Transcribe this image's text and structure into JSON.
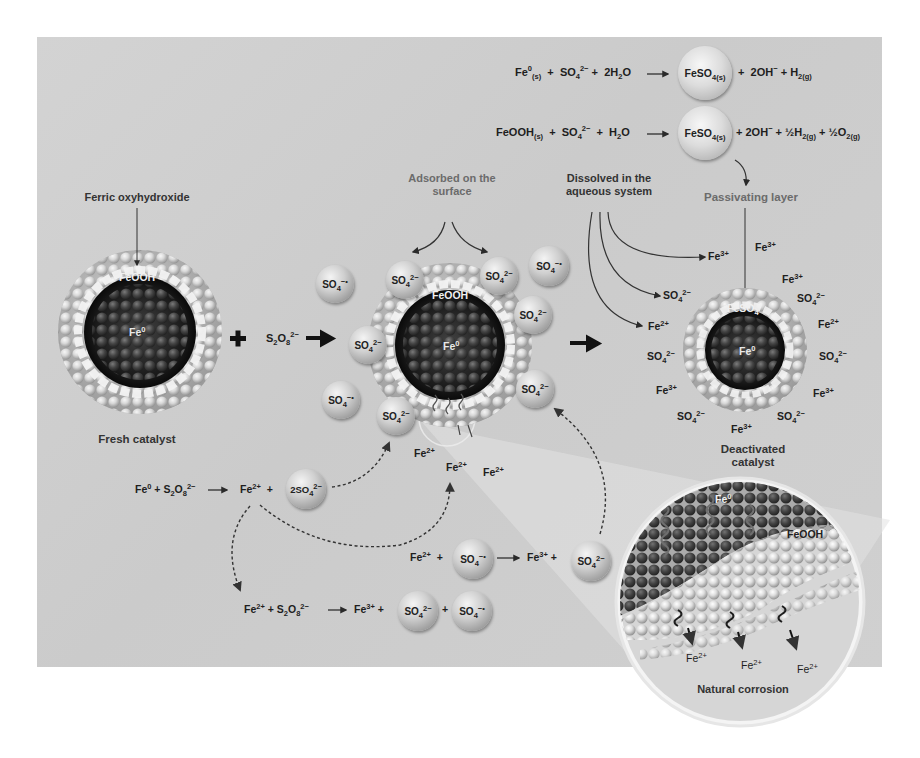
{
  "figure": {
    "background_color": "#cfcfcf",
    "panel_label": "Fe0 catalyst deactivation during persulfate activation"
  },
  "equations": {
    "eq1": {
      "reactants": [
        "Fe0(s)",
        "SO4 2-",
        "2H2O"
      ],
      "product_sphere": "FeSO4(s)",
      "products": [
        "2OH-",
        "H2(g)"
      ],
      "display": {
        "r1_base": "Fe",
        "r1_sup": "0",
        "r1_sub": "(s)",
        "r2_base": "SO",
        "r2_sub": "4",
        "r2_sup": "2−",
        "r3": "2H",
        "r3_sub": "2",
        "r3_end": "O",
        "sphere_base": "FeSO",
        "sphere_sub": "4(s)",
        "p1": "2OH",
        "p1_sup": "−",
        "p2": "H",
        "p2_sub": "2(g)"
      }
    },
    "eq2": {
      "reactants": [
        "FeOOH(s)",
        "SO4 2-",
        "H2O"
      ],
      "product_sphere": "FeSO4(s)",
      "products": [
        "2OH-",
        "1/2 H2(g)",
        "1/2 O2(g)"
      ],
      "display": {
        "r1_base": "FeOOH",
        "r1_sub": "(s)",
        "r2_base": "SO",
        "r2_sub": "4",
        "r2_sup": "2−",
        "r3": "H",
        "r3_sub": "2",
        "r3_end": "O",
        "sphere_base": "FeSO",
        "sphere_sub": "4(s)",
        "p1": "2OH",
        "p1_sup": "−",
        "p2": "½H",
        "p2_sub": "2(g)",
        "p3": "½O",
        "p3_sub": "2(g)"
      }
    },
    "eq3": {
      "reactants": [
        "Fe0",
        "S2O8 2-"
      ],
      "products": [
        "Fe2+",
        "2SO4 2-"
      ],
      "display": {
        "r1_base": "Fe",
        "r1_sup": "0",
        "r2_base": "S",
        "r2_sub1": "2",
        "r2_mid": "O",
        "r2_sub2": "8",
        "r2_sup": "2−",
        "p1_base": "Fe",
        "p1_sup": "2+",
        "sphere": "2SO",
        "sphere_sub": "4",
        "sphere_sup": "2−"
      }
    },
    "eq4": {
      "reactants": [
        "Fe2+",
        "SO4 -•"
      ],
      "products": [
        "Fe3+",
        "SO4 2-"
      ],
      "display": {
        "r1_base": "Fe",
        "r1_sup": "2+",
        "sphere1": "SO",
        "sphere1_sub": "4",
        "sphere1_sup": "−•",
        "p1_base": "Fe",
        "p1_sup": "3+",
        "sphere2": "SO",
        "sphere2_sub": "4",
        "sphere2_sup": "2−"
      }
    },
    "eq5": {
      "reactants": [
        "Fe2+",
        "S2O8 2-"
      ],
      "products": [
        "Fe3+",
        "SO4 2-",
        "SO4 -•"
      ],
      "display": {
        "r1_base": "Fe",
        "r1_sup": "2+",
        "r2_base": "S",
        "r2_sub1": "2",
        "r2_mid": "O",
        "r2_sub2": "8",
        "r2_sup": "2−",
        "p1_base": "Fe",
        "p1_sup": "3+",
        "sphere1": "SO",
        "sphere1_sub": "4",
        "sphere1_sup": "2−",
        "sphere2": "SO",
        "sphere2_sub": "4",
        "sphere2_sup": "−•"
      }
    },
    "plus": "+",
    "oxidant": {
      "base": "S",
      "sub1": "2",
      "mid": "O",
      "sub2": "8",
      "sup": "2−"
    }
  },
  "labels": {
    "ferric_oxyhydroxide": "Ferric oxyhydroxide",
    "fresh_catalyst": "Fresh catalyst",
    "adsorbed_line1": "Adsorbed on the",
    "adsorbed_line2": "surface",
    "dissolved_line1": "Dissolved in the",
    "dissolved_line2": "aqueous system",
    "passivating_layer": "Passivating layer",
    "deactivated_line1": "Deactivated",
    "deactivated_line2": "catalyst",
    "natural_corrosion": "Natural corrosion"
  },
  "particles": {
    "fresh": {
      "shell": "FeOOH",
      "core": "Fe",
      "core_sup": "0"
    },
    "active": {
      "shell": "FeOOH",
      "core": "Fe",
      "core_sup": "0"
    },
    "deactivated": {
      "shell": "FeSO",
      "shell_sub": "4",
      "core": "Fe",
      "core_sup": "0"
    },
    "inset": {
      "core": "Fe",
      "core_sup": "0",
      "shell": "FeOOH"
    }
  },
  "species": {
    "so4_dianion": {
      "base": "SO",
      "sub": "4",
      "sup": "2−"
    },
    "so4_radical": {
      "base": "SO",
      "sub": "4",
      "sup": "−•"
    },
    "fe2": {
      "base": "Fe",
      "sup": "2+"
    },
    "fe3": {
      "base": "Fe",
      "sup": "3+"
    }
  },
  "released_fe2_near_active": [
    "Fe2+",
    "Fe2+",
    "Fe2+"
  ],
  "dissolved_arrows_targets": [
    "Fe3+",
    "SO4 2-",
    "Fe2+"
  ],
  "deactivated_surrounding_ions": [
    "Fe3+",
    "Fe3+",
    "SO4 2-",
    "Fe2+",
    "SO4 2-",
    "Fe3+",
    "SO4 2-",
    "Fe3+",
    "SO4 2-",
    "Fe3+",
    "SO4 2-",
    "Fe2+"
  ],
  "inset_released": [
    "Fe2+",
    "Fe2+",
    "Fe2+"
  ]
}
